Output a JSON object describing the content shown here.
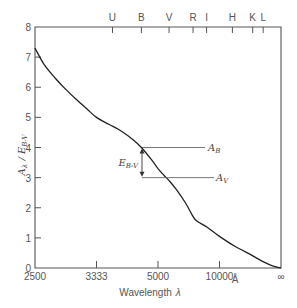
{
  "chart_data": {
    "type": "line",
    "title": "",
    "xlabel": "Wavelength λ",
    "ylabel": "A_λ / E_B-V",
    "x_scale": "inverse wavelength (1/λ)",
    "x_unit": "Å",
    "x_tick_labels": [
      "2500",
      "3333",
      "5000",
      "10000",
      "∞"
    ],
    "x_tick_values_inverse_um": [
      4,
      3,
      2,
      1,
      0
    ],
    "y_tick_labels": [
      "0",
      "1",
      "2",
      "3",
      "4",
      "5",
      "6",
      "7",
      "8"
    ],
    "ylim": [
      0,
      8
    ],
    "grid": false,
    "top_axis_bands": [
      {
        "label": "U",
        "inv_um": 2.74
      },
      {
        "label": "B",
        "inv_um": 2.27
      },
      {
        "label": "V",
        "inv_um": 1.82
      },
      {
        "label": "R",
        "inv_um": 1.43
      },
      {
        "label": "I",
        "inv_um": 1.21
      },
      {
        "label": "H",
        "inv_um": 0.79
      },
      {
        "label": "K",
        "inv_um": 0.46
      },
      {
        "label": "L",
        "inv_um": 0.29
      }
    ],
    "series": [
      {
        "name": "Interstellar extinction curve",
        "x_inverse_um": [
          4.0,
          3.85,
          3.67,
          3.5,
          3.33,
          3.15,
          3.0,
          2.8,
          2.6,
          2.4,
          2.27,
          2.1,
          2.0,
          1.9,
          1.82,
          1.7,
          1.55,
          1.45,
          1.38,
          1.2,
          1.0,
          0.75,
          0.5,
          0.3,
          0.15,
          0.05,
          0.0
        ],
        "values": [
          7.3,
          6.75,
          6.3,
          5.93,
          5.6,
          5.27,
          5.0,
          4.77,
          4.55,
          4.25,
          4.0,
          3.58,
          3.3,
          3.07,
          2.9,
          2.6,
          2.15,
          1.78,
          1.58,
          1.35,
          1.05,
          0.72,
          0.45,
          0.22,
          0.08,
          0.02,
          0.0
        ]
      }
    ],
    "annotations": [
      {
        "label": "A_B",
        "value": 4.0,
        "type": "horizontal-line"
      },
      {
        "label": "A_V",
        "value": 3.0,
        "type": "horizontal-line"
      },
      {
        "label": "E_B-V",
        "type": "double-arrow",
        "from": 4.0,
        "to": 3.0
      }
    ]
  },
  "labels": {
    "xlabel": "Wavelength",
    "xlabel_symbol": "λ",
    "ylabel_main": "A",
    "ylabel_sub1": "λ",
    "ylabel_slash": " / E",
    "ylabel_sub2": "B-V",
    "unit": "Å",
    "ab_main": "A",
    "ab_sub": "B",
    "av_main": "A",
    "av_sub": "V",
    "ebv_main": "E",
    "ebv_sub": "B-V"
  }
}
